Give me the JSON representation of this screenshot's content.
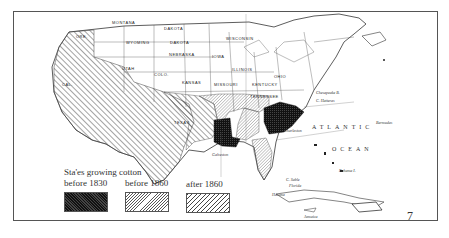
{
  "map": {
    "subject": "Cotton-growing states of the United States",
    "state_labels": [
      "MONTANA",
      "DAKOTA",
      "DAKOTA",
      "WYOMING",
      "NEBRASKA",
      "IOWA",
      "UTAH",
      "COLO.",
      "KANSAS",
      "MISSOURI",
      "KENTUCKY",
      "TENNESSEE",
      "OHIO",
      "WISCONSIN",
      "ILLINOIS",
      "TEXAS",
      "ORE.",
      "CAL."
    ],
    "place_labels": [
      "Galveston",
      "Charleston",
      "Chesapeake B.",
      "C. Hatteras",
      "Bermudas",
      "Bahama I.",
      "C. Sable",
      "Florida",
      "Havana",
      "Jamaica"
    ],
    "ocean_labels": [
      "ATLANTIC",
      "OCEAN"
    ],
    "page_number": "7"
  },
  "legend": {
    "title": "Sta'es growing cotton",
    "items": [
      {
        "label": "before 1830",
        "pattern": "dark-stipple",
        "color": "#1a1a1a"
      },
      {
        "label": "before 1860",
        "pattern": "fine-hatch",
        "color": "#888888"
      },
      {
        "label": "after 1860",
        "pattern": "coarse-hatch",
        "color": "#666666"
      }
    ]
  }
}
